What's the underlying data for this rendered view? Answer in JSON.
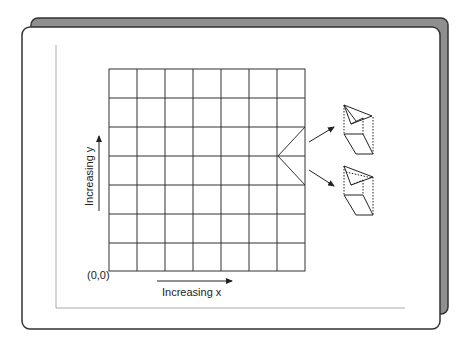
{
  "diagram": {
    "labels": {
      "origin": "(0,0)",
      "x_axis": "Increasing x",
      "y_axis": "Increasing y"
    },
    "grid": {
      "columns": 7,
      "rows": 7
    },
    "icons": [
      "folded-cell-3d-icon-upper",
      "folded-cell-3d-icon-lower"
    ],
    "colors": {
      "back_card": "#8f8f8f",
      "card_border": "#333333",
      "grid_line": "#333333",
      "bracket_line": "#aaaaaa"
    }
  }
}
